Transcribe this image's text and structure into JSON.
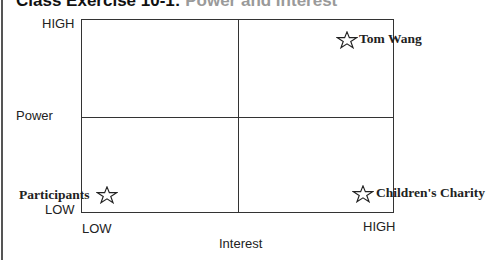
{
  "title": {
    "part1": "Class Exercise 10-1:",
    "part2": "Power and Interest"
  },
  "axes": {
    "y_label": "Power",
    "y_high": "HIGH",
    "y_low": "LOW",
    "x_label": "Interest",
    "x_low": "LOW",
    "x_high": "HIGH"
  },
  "stakeholders": [
    {
      "name": "Tom Wang",
      "power": "high",
      "interest": "high",
      "icon": "star-icon"
    },
    {
      "name": "Participants",
      "power": "low",
      "interest": "low",
      "icon": "star-icon"
    },
    {
      "name": "Children's Charity",
      "power": "low",
      "interest": "high",
      "icon": "star-icon"
    }
  ],
  "colors": {
    "line": "#333333",
    "text": "#222222",
    "title_secondary": "#9a9a9a"
  }
}
